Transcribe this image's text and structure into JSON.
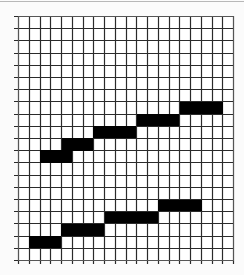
{
  "figure": {
    "type": "grid-with-step-bars",
    "grid": {
      "left": 18,
      "right": 233,
      "top": 16,
      "bottom": 260,
      "columns": 20,
      "rows": 20,
      "line_color": "#2a2a2a",
      "border_color": "#555555",
      "tick_extension_left": 4,
      "tick_extension_bottom": 4
    },
    "colors": {
      "background": "#fbfbfb",
      "cell_fill": "#ffffff",
      "bar_fill": "#000000"
    },
    "upper_staircase": [
      {
        "x": 40,
        "y": 150,
        "w": 32,
        "h": 13
      },
      {
        "x": 62,
        "y": 138,
        "w": 31,
        "h": 13
      },
      {
        "x": 93,
        "y": 126,
        "w": 43,
        "h": 12
      },
      {
        "x": 137,
        "y": 114,
        "w": 42,
        "h": 12
      },
      {
        "x": 180,
        "y": 102,
        "w": 43,
        "h": 12
      }
    ],
    "lower_staircase": [
      {
        "x": 29,
        "y": 236,
        "w": 32,
        "h": 12
      },
      {
        "x": 61,
        "y": 224,
        "w": 43,
        "h": 12
      },
      {
        "x": 105,
        "y": 212,
        "w": 53,
        "h": 11
      },
      {
        "x": 158,
        "y": 200,
        "w": 44,
        "h": 11
      }
    ]
  }
}
